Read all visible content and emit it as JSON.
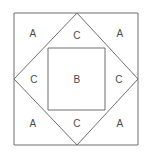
{
  "figure": {
    "background_color": "#ffffff",
    "stroke_color": "#6f6f6f",
    "label_color": "#4a4a4a",
    "canvas": {
      "width": 152,
      "height": 158
    },
    "shapes": {
      "outer_square": {
        "name": "outer-square",
        "points": "14,13 138,13 138,145 14,145"
      },
      "diamond": {
        "name": "diamond",
        "points": "77,13 138,79 77,145 14,79"
      },
      "inner_square": {
        "name": "inner-square",
        "points": "48,48 105,48 105,110 48,110"
      }
    },
    "labels": [
      {
        "id": "label-a-top-left",
        "text": "A",
        "x": 33,
        "y": 34
      },
      {
        "id": "label-c-top",
        "text": "C",
        "x": 77,
        "y": 36
      },
      {
        "id": "label-a-top-right",
        "text": "A",
        "x": 120,
        "y": 34
      },
      {
        "id": "label-c-left",
        "text": "C",
        "x": 34,
        "y": 80
      },
      {
        "id": "label-b-center",
        "text": "B",
        "x": 77,
        "y": 80
      },
      {
        "id": "label-c-right",
        "text": "C",
        "x": 119,
        "y": 80
      },
      {
        "id": "label-a-bottom-left",
        "text": "A",
        "x": 33,
        "y": 124
      },
      {
        "id": "label-c-bottom",
        "text": "C",
        "x": 77,
        "y": 124
      },
      {
        "id": "label-a-bottom-right",
        "text": "A",
        "x": 120,
        "y": 124
      }
    ]
  }
}
